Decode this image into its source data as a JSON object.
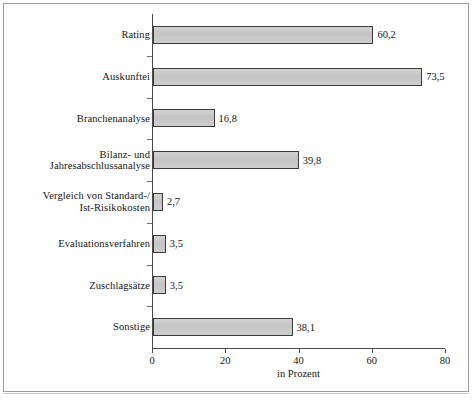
{
  "chart_data": {
    "type": "bar",
    "orientation": "horizontal",
    "title": "",
    "subtitle": "",
    "xlabel": "in Prozent",
    "ylabel": "",
    "xlim": [
      0,
      80
    ],
    "xticks": [
      "0",
      "20",
      "40",
      "60",
      "80"
    ],
    "grid": false,
    "legend": false,
    "decimal_separator": ",",
    "categories": [
      "Rating",
      "Auskunftei",
      "Branchenanalyse",
      "Bilanz- und\nJahresabschlussanalyse",
      "Vergleich von Standard-/\nIst-Risikokosten",
      "Evaluationsverfahren",
      "Zuschlagsätze",
      "Sonstige"
    ],
    "values": [
      60.2,
      73.5,
      16.8,
      39.8,
      2.7,
      3.5,
      3.5,
      38.1
    ],
    "value_labels": [
      "60,2",
      "73,5",
      "16,8",
      "39,8",
      "2,7",
      "3,5",
      "3,5",
      "38,1"
    ],
    "colors": {
      "bar_fill": "#c9c9c9",
      "bar_border": "#3a3a3a",
      "axis": "#4a4a4a",
      "text": "#151515",
      "frame": "#9a9a9a",
      "background": "#ffffff"
    }
  }
}
